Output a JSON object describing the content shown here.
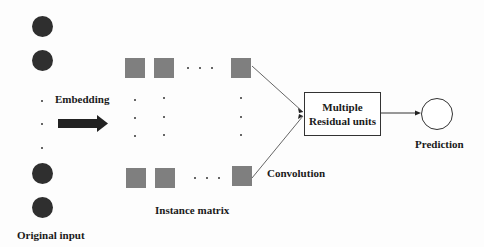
{
  "diagram": {
    "labels": {
      "embedding": "Embedding",
      "original_input": "Original input",
      "instance_matrix": "Instance matrix",
      "convolution": "Convolution",
      "residual_line1": "Multiple",
      "residual_line2": "Residual units",
      "prediction": "Prediction"
    },
    "ellipsis": "· · ·",
    "colors": {
      "input_node": "#2f2f2f",
      "matrix_cell": "#7f7f7f",
      "arrow": "#222222",
      "lines": "#555555"
    },
    "nodes": [
      {
        "id": "input-node-1"
      },
      {
        "id": "input-node-2"
      },
      {
        "id": "input-node-3"
      },
      {
        "id": "input-node-4"
      }
    ]
  }
}
